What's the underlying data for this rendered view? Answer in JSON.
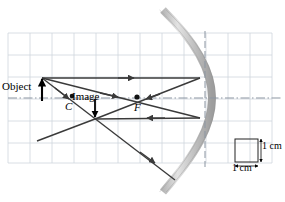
{
  "figure": {
    "type": "ray-diagram",
    "labels": {
      "object": "Object",
      "image": "Image",
      "center_of_curvature": "C",
      "focal_point": "F",
      "scale_vertical": "1 cm",
      "scale_horizontal": "1 cm"
    },
    "colors": {
      "grid": "#cfd5dd",
      "axis": "#9aa3ae",
      "ray": "#3a3a3a",
      "mirror_light": "#d8d8d8",
      "mirror_dark": "#a9a9a9",
      "ink": "#000000"
    },
    "grid": {
      "left": 8,
      "top": 33,
      "right": 272,
      "bottom": 163,
      "cell_px": 22,
      "cols": 12,
      "rows": 6,
      "cell_value": "1 cm"
    },
    "geometry": {
      "principal_axis_y": 98,
      "mirror_vertex": [
        205,
        98
      ],
      "object_base": [
        42,
        98
      ],
      "object_tip": [
        42,
        78
      ],
      "image_point": [
        95,
        119
      ],
      "center_of_curvature_point": [
        72,
        96
      ],
      "focal_point_point": [
        137,
        97
      ],
      "optical_axis_dashed_x": 205
    },
    "rays": [
      {
        "name": "parallel-incident-ray",
        "from": [
          42,
          78
        ],
        "to": [
          200,
          78
        ]
      },
      {
        "name": "parallel-reflected-ray",
        "from": [
          200,
          78
        ],
        "to": [
          95,
          119
        ]
      },
      {
        "name": "focal-incident-ray",
        "from": [
          42,
          78
        ],
        "to": [
          200,
          118
        ]
      },
      {
        "name": "focal-reflected-ray",
        "from": [
          200,
          118
        ],
        "to": [
          95,
          119
        ]
      },
      {
        "name": "center-ray",
        "from": [
          42,
          78
        ],
        "to": [
          95,
          119
        ]
      },
      {
        "name": "center-ray-extension",
        "from": [
          95,
          119
        ],
        "to": [
          175,
          180
        ]
      },
      {
        "name": "reflected-ray-extension",
        "from": [
          95,
          119
        ],
        "to": [
          37,
          141
        ]
      }
    ],
    "scale_box": {
      "x": 235,
      "y": 139,
      "size": 23
    }
  }
}
